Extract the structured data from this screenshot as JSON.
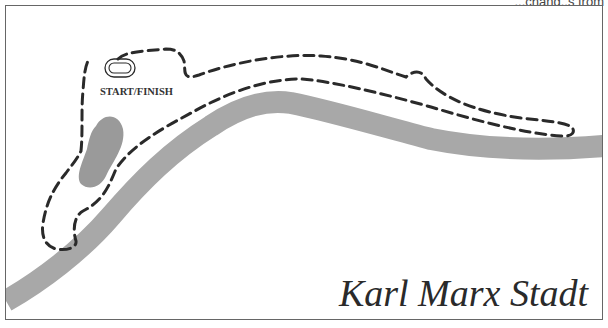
{
  "header": {
    "cut_off_text": "...chang..s from"
  },
  "map": {
    "title": "Karl Marx Stadt",
    "start_finish_label": "START/FINISH",
    "colors": {
      "border": "#666666",
      "river": "#a8a8a8",
      "lake": "#9a9a9a",
      "track": "#2a2a2a",
      "background": "#ffffff"
    },
    "features": [
      {
        "type": "river",
        "name": "river-band"
      },
      {
        "type": "lake",
        "name": "lake"
      },
      {
        "type": "track",
        "name": "circuit-outer-dashed-line"
      },
      {
        "type": "track",
        "name": "circuit-inner-dashed-line"
      },
      {
        "type": "marker",
        "name": "start-finish-loop"
      }
    ]
  }
}
